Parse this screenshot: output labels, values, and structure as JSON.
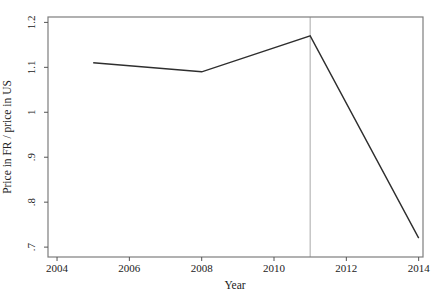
{
  "figure": {
    "background": "#ffffff",
    "axis_color": "#7d7d7d",
    "tick_color": "#555555",
    "line_color": "#2e2e2e",
    "ref_line_color": "#b7b7b7",
    "text_color": "#222222"
  },
  "chart_data": {
    "type": "line",
    "title": "",
    "xlabel": "Year",
    "ylabel": "Price in FR / price in US",
    "series": [
      {
        "name": "price-ratio-fr-us",
        "x": [
          2005,
          2008,
          2011,
          2014
        ],
        "y": [
          1.11,
          1.09,
          1.17,
          0.72
        ]
      }
    ],
    "xlim": [
      2003.75,
      2014.12
    ],
    "ylim": [
      0.678,
      1.212
    ],
    "x_ticks": [
      2004,
      2006,
      2008,
      2010,
      2012,
      2014
    ],
    "x_tick_labels": [
      "2004",
      "2006",
      "2008",
      "2010",
      "2012",
      "2014"
    ],
    "y_ticks": [
      0.7,
      0.8,
      0.9,
      1.0,
      1.1,
      1.2
    ],
    "y_tick_labels": [
      ".7",
      ".8",
      ".9",
      "1",
      "1.1",
      "1.2"
    ],
    "ref_line_x": 2011,
    "grid": false,
    "legend": false
  }
}
